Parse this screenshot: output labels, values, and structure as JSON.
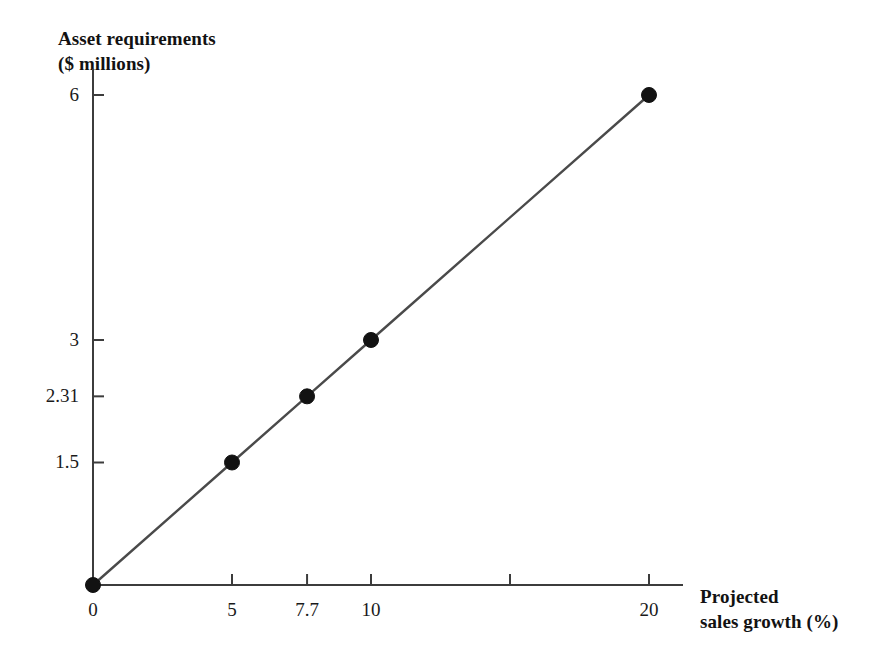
{
  "chart_data": {
    "type": "line",
    "title": "",
    "ylabel_lines": [
      "Asset requirements",
      "($ millions)"
    ],
    "xlabel_lines": [
      "Projected",
      "sales growth (%)"
    ],
    "xlabel": "Projected sales growth (%)",
    "ylabel": "Asset requirements ($ millions)",
    "x": [
      0,
      5,
      7.7,
      10,
      20
    ],
    "values": [
      0,
      1.5,
      2.31,
      3,
      6
    ],
    "series": [
      {
        "name": "Asset requirements",
        "x": [
          0,
          5,
          7.7,
          10,
          20
        ],
        "values": [
          0,
          1.5,
          2.31,
          3,
          6
        ]
      }
    ],
    "xlim": [
      0,
      21.2
    ],
    "ylim": [
      0,
      6.32
    ],
    "xticks": [
      0,
      5,
      7.7,
      10,
      15,
      20
    ],
    "xticklabels": [
      "0",
      "5",
      "7.7",
      "10",
      "",
      "20"
    ],
    "yticks": [
      1.5,
      2.31,
      3,
      6
    ],
    "yticklabels": [
      "1.5",
      "2.31",
      "3",
      "6"
    ],
    "grid": false,
    "legend": false,
    "legend_position": "none",
    "marker": "circle",
    "marker_color": "#121212",
    "line_color": "#4a4a4a",
    "axis_color": "#3c3c3c"
  },
  "geometry": {
    "origin_x": 93,
    "origin_y": 585,
    "x_axis_end": 683,
    "y_axis_top": 95,
    "px_per_x": 27.8,
    "px_per_y": 81.67
  }
}
